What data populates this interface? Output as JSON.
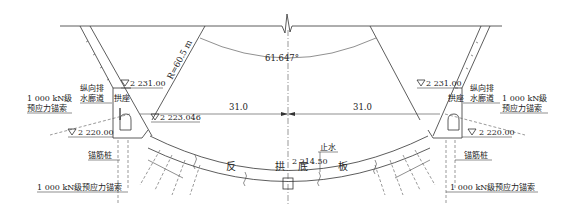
{
  "diagram": {
    "angle_label": "61.647°",
    "radius_label": "R=60.5 m",
    "dims": {
      "left": "31.0",
      "right": "31.0"
    },
    "elevations": {
      "left_top": "2 231.00",
      "right_top": "2 231.00",
      "left_base": "2 220.00",
      "right_base": "2 220.00",
      "left_springing": "2 223.046",
      "bottom": "2 214.50"
    },
    "labels": {
      "left_gallery_1": "纵向排",
      "left_gallery_2": "水廊道",
      "right_gallery_1": "纵向排",
      "right_gallery_2": "水廊道",
      "left_abutment": "拱座",
      "right_abutment": "拱座",
      "left_anchor_1": "1 000 kN级",
      "left_anchor_2": "预应力锚索",
      "right_anchor_1": "1 000 kN级",
      "right_anchor_2": "预应力锚索",
      "left_pile": "锚筋桩",
      "right_pile": "锚筋桩",
      "left_bottom_anchor": "1 000 kN级预应力锚索",
      "right_bottom_anchor": "1 000 kN级预应力锚索",
      "waterstop": "止水",
      "slab_chars": [
        "反",
        "拱",
        "底",
        "板"
      ]
    }
  }
}
